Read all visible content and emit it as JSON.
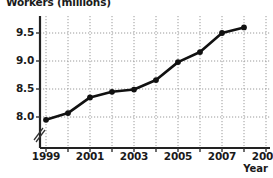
{
  "chart_data": {
    "type": "line",
    "title": "",
    "ylabel": "Workers (millions)",
    "xlabel": "Year",
    "x": [
      1999,
      2000,
      2001,
      2002,
      2003,
      2004,
      2005,
      2006,
      2007,
      2008
    ],
    "values": [
      7.95,
      8.07,
      8.35,
      8.45,
      8.49,
      8.66,
      8.98,
      9.16,
      9.5,
      9.6
    ],
    "series": [
      {
        "name": "Workers",
        "values": [
          7.95,
          8.07,
          8.35,
          8.45,
          8.49,
          8.66,
          8.98,
          9.16,
          9.5,
          9.6
        ]
      }
    ],
    "x_ticks": [
      1999,
      2000,
      2001,
      2002,
      2003,
      2004,
      2005,
      2006,
      2007,
      2008,
      2009
    ],
    "x_tick_labels": [
      "1999",
      "",
      "2001",
      "",
      "2003",
      "",
      "2005",
      "",
      "2007",
      "",
      "2009"
    ],
    "y_ticks": [
      8.0,
      8.5,
      9.0,
      9.5
    ],
    "y_tick_labels": [
      "8.0",
      "8.5",
      "9.0",
      "9.5"
    ],
    "xlim": [
      1999,
      2009
    ],
    "ylim": [
      7.75,
      9.75
    ],
    "grid": true,
    "legend": "none",
    "y_axis_break": true,
    "marker": "filled-circle",
    "line_color": "#111111",
    "grid_color": "#9a9a9a"
  },
  "axis": {
    "y_title": "Workers (millions)",
    "x_title": "Year",
    "y_tick_labels": [
      "9.5",
      "9.0",
      "8.5",
      "8.0"
    ],
    "x_tick_labels": [
      "1999",
      "2001",
      "2003",
      "2005",
      "2007",
      "2009"
    ]
  }
}
